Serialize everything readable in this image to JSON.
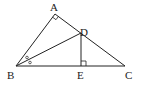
{
  "diagram": {
    "type": "geometry-triangle",
    "points": {
      "A": {
        "label": "A",
        "x": 55,
        "y": 14,
        "lx": 50,
        "ly": 11
      },
      "B": {
        "label": "B",
        "x": 16,
        "y": 66,
        "lx": 7,
        "ly": 79
      },
      "C": {
        "label": "C",
        "x": 125,
        "y": 66,
        "lx": 125,
        "ly": 79
      },
      "D": {
        "label": "D",
        "x": 81,
        "y": 33,
        "lx": 79,
        "ly": 37
      },
      "E": {
        "label": "E",
        "x": 81,
        "y": 66,
        "lx": 77,
        "ly": 79
      }
    },
    "segments": [
      "AB",
      "AC",
      "BC",
      "BD",
      "DE"
    ],
    "marks": {
      "right_angle_A": "right angle at A",
      "right_angle_E": "right angle at E",
      "equal_angles_B": "angle ABD = angle DBC"
    },
    "stroke_color": "#222222"
  }
}
